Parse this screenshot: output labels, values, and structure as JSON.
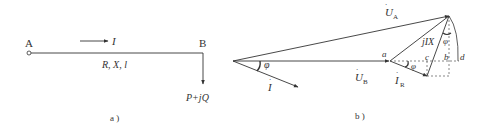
{
  "panel_a": {
    "node_start": "A",
    "node_end": "B",
    "current": "I",
    "line_params": "R, X, l",
    "load": "P+jQ",
    "caption": "a )"
  },
  "panel_b": {
    "U_A": "U",
    "U_A_sub": "A",
    "U_B": "U",
    "U_B_sub": "B",
    "I": "I",
    "I_R": "I",
    "I_R_sub": "R",
    "jIX": "jIX",
    "phi": "φ",
    "points": {
      "a": "a",
      "b": "b",
      "c": "c",
      "d": "d"
    },
    "caption": "b )"
  },
  "colors": {
    "stroke": "#333333",
    "dashed": "#555555"
  }
}
